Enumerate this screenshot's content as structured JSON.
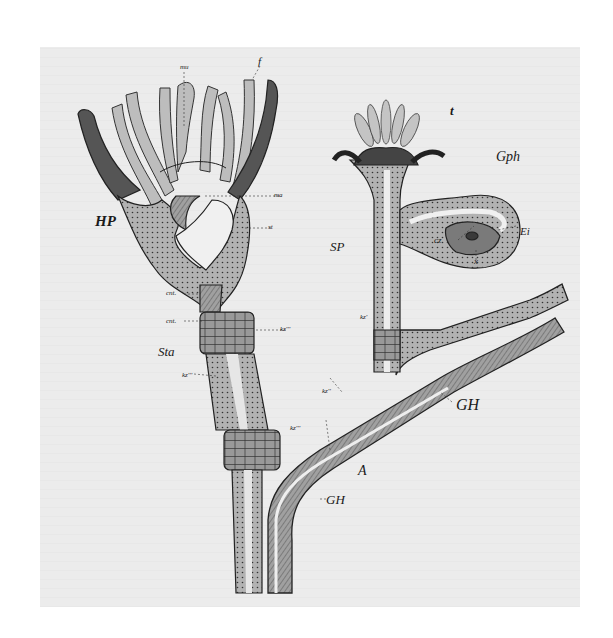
{
  "figure": {
    "colors": {
      "paper": "#ececec",
      "ink": "#1a1a1a",
      "tissue": "#a9a9a9",
      "tentacle": "#bdbdbd",
      "dark_tissue": "#5a5a5a",
      "cavity": "#f0f0f0"
    },
    "labels": {
      "HP": "HP",
      "SP": "SP",
      "Gph": "Gph",
      "Ei": "Ei",
      "x": "x",
      "cz": "cz",
      "t": "t",
      "f": "f",
      "mu": "mu",
      "ma": "ma",
      "st": "st",
      "Sta": "Sta",
      "cnt1": "cnt.",
      "cnt2": "cnt.",
      "kz_m": "kz'''",
      "kz_mid": "kz'''",
      "kz_right": "kz''",
      "kz_top": "kz'",
      "kz_branch": "kz''",
      "kz_lower": "kz'''",
      "GH_right": "GH",
      "GH_bottom": "GH",
      "A": "A"
    }
  }
}
